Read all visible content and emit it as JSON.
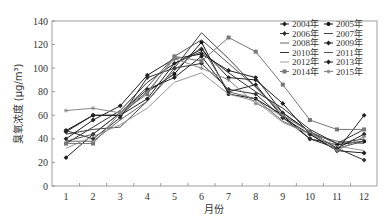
{
  "chart_data": {
    "type": "line",
    "title": "",
    "xlabel": "月份",
    "ylabel": "臭氧浓度 (μg/m³)",
    "ylim": [
      0,
      140
    ],
    "yticks": [
      0,
      20,
      40,
      60,
      80,
      100,
      120,
      140
    ],
    "x": [
      1,
      2,
      3,
      4,
      5,
      6,
      7,
      8,
      9,
      10,
      11,
      12
    ],
    "categories": [
      "1",
      "2",
      "3",
      "4",
      "5",
      "6",
      "7",
      "8",
      "9",
      "10",
      "11",
      "12"
    ],
    "grid": false,
    "legend_position": "top-right",
    "series": [
      {
        "name": "2004年",
        "marker": "diamond",
        "color": "#222",
        "values": [
          24,
          44,
          62,
          82,
          92,
          110,
          80,
          86,
          58,
          44,
          30,
          28
        ]
      },
      {
        "name": "2005年",
        "marker": "circle",
        "color": "#111",
        "values": [
          47,
          60,
          60,
          80,
          95,
          122,
          78,
          74,
          60,
          40,
          35,
          38
        ]
      },
      {
        "name": "2006年",
        "marker": "diamond",
        "color": "#333",
        "values": [
          47,
          40,
          58,
          92,
          100,
          104,
          82,
          78,
          58,
          40,
          32,
          22
        ]
      },
      {
        "name": "2007年",
        "marker": "none",
        "color": "#444",
        "values": [
          44,
          48,
          50,
          72,
          100,
          130,
          108,
          84,
          62,
          46,
          36,
          40
        ]
      },
      {
        "name": "2008年",
        "marker": "none",
        "color": "#666",
        "values": [
          38,
          38,
          56,
          72,
          98,
          118,
          80,
          74,
          55,
          44,
          38,
          36
        ]
      },
      {
        "name": "2009年",
        "marker": "diamond",
        "color": "#222",
        "values": [
          40,
          56,
          68,
          94,
          108,
          112,
          98,
          92,
          62,
          46,
          32,
          44
        ]
      },
      {
        "name": "2010年",
        "marker": "none",
        "color": "#333",
        "values": [
          36,
          50,
          64,
          88,
          104,
          114,
          96,
          80,
          66,
          48,
          36,
          48
        ]
      },
      {
        "name": "2011年",
        "marker": "none",
        "color": "#555",
        "values": [
          38,
          44,
          62,
          84,
          110,
          124,
          104,
          84,
          60,
          46,
          32,
          38
        ]
      },
      {
        "name": "2012年",
        "marker": "none",
        "color": "#999",
        "values": [
          32,
          42,
          52,
          66,
          88,
          96,
          78,
          72,
          54,
          44,
          34,
          30
        ]
      },
      {
        "name": "2013年",
        "marker": "diamond",
        "color": "#222",
        "values": [
          46,
          60,
          60,
          74,
          104,
          116,
          92,
          90,
          70,
          44,
          30,
          60
        ]
      },
      {
        "name": "2014年",
        "marker": "square",
        "color": "#777",
        "values": [
          36,
          36,
          62,
          78,
          110,
          106,
          126,
          114,
          86,
          56,
          48,
          48
        ]
      },
      {
        "name": "2015年",
        "marker": "star",
        "color": "#888",
        "values": [
          64,
          66,
          62,
          80,
          108,
          100,
          90,
          70,
          60,
          46,
          30,
          42
        ]
      }
    ]
  },
  "legend": {
    "items": [
      "2004年",
      "2005年",
      "2006年",
      "2007年",
      "2008年",
      "2009年",
      "2010年",
      "2011年",
      "2012年",
      "2013年",
      "2014年",
      "2015年"
    ]
  },
  "axes": {
    "y_labels": [
      "0",
      "20",
      "40",
      "60",
      "80",
      "100",
      "120",
      "140"
    ],
    "x_labels": [
      "1",
      "2",
      "3",
      "4",
      "5",
      "6",
      "7",
      "8",
      "9",
      "10",
      "11",
      "12"
    ],
    "xlabel": "月份",
    "ylabel": "臭氧浓度 (μg/m³)"
  }
}
